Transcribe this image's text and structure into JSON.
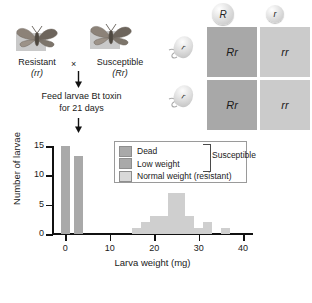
{
  "cross": {
    "parent_left": {
      "name": "Resistant",
      "genotype": "(rr)",
      "icon": "moth-icon"
    },
    "parent_right": {
      "name": "Susceptible",
      "genotype": "(Rr)",
      "icon": "moth-icon"
    },
    "cross_symbol": "×",
    "treatment_line1": "Feed larvae Bt toxin",
    "treatment_line2": "for 21 days",
    "arrow_icon": "down-arrow-icon"
  },
  "punnett": {
    "egg_gametes": [
      "R",
      "r"
    ],
    "sperm_gametes": [
      "r",
      "r"
    ],
    "egg_icon": "egg-cell-icon",
    "sperm_icon": "sperm-cell-icon",
    "cells": [
      {
        "genotype": "Rr",
        "shade": "dark"
      },
      {
        "genotype": "rr",
        "shade": "light"
      },
      {
        "genotype": "Rr",
        "shade": "dark"
      },
      {
        "genotype": "rr",
        "shade": "light"
      }
    ]
  },
  "chart_data": {
    "type": "bar",
    "title": "",
    "xlabel": "Larva weight (mg)",
    "ylabel": "Number of larvae",
    "xlim": [
      -3,
      42
    ],
    "ylim": [
      0,
      15
    ],
    "xticks": [
      0,
      10,
      20,
      30,
      40
    ],
    "yticks": [
      0,
      5,
      10,
      15
    ],
    "xtick_labels": [
      "0",
      "10",
      "20",
      "30",
      "40"
    ],
    "ytick_labels": [
      "0",
      "5",
      "10",
      "15"
    ],
    "grid": false,
    "legend_position": "upper-center",
    "bar_width_mg": 2,
    "series": [
      {
        "name": "Dead",
        "color": "#a9a9a9",
        "x": [
          0
        ],
        "values": [
          15
        ]
      },
      {
        "name": "Low weight",
        "color": "#a9a9a9",
        "x": [
          3
        ],
        "values": [
          13.3
        ]
      },
      {
        "name": "Normal weight (resistant)",
        "color": "#cfcfcf",
        "x": [
          16,
          18,
          20,
          22,
          24,
          26,
          28,
          30,
          32,
          36
        ],
        "values": [
          1,
          2,
          3,
          3,
          7,
          7,
          3,
          1,
          2,
          1
        ]
      }
    ],
    "legend": [
      {
        "label": "Dead",
        "swatch": "#a9a9a9"
      },
      {
        "label": "Low weight",
        "swatch": "#a9a9a9"
      },
      {
        "label": "Normal weight (resistant)",
        "swatch": "#d8d8d8"
      }
    ],
    "annotations": [
      {
        "text": "Susceptible",
        "type": "brace-group",
        "covers": [
          "Dead",
          "Low weight"
        ]
      }
    ]
  }
}
